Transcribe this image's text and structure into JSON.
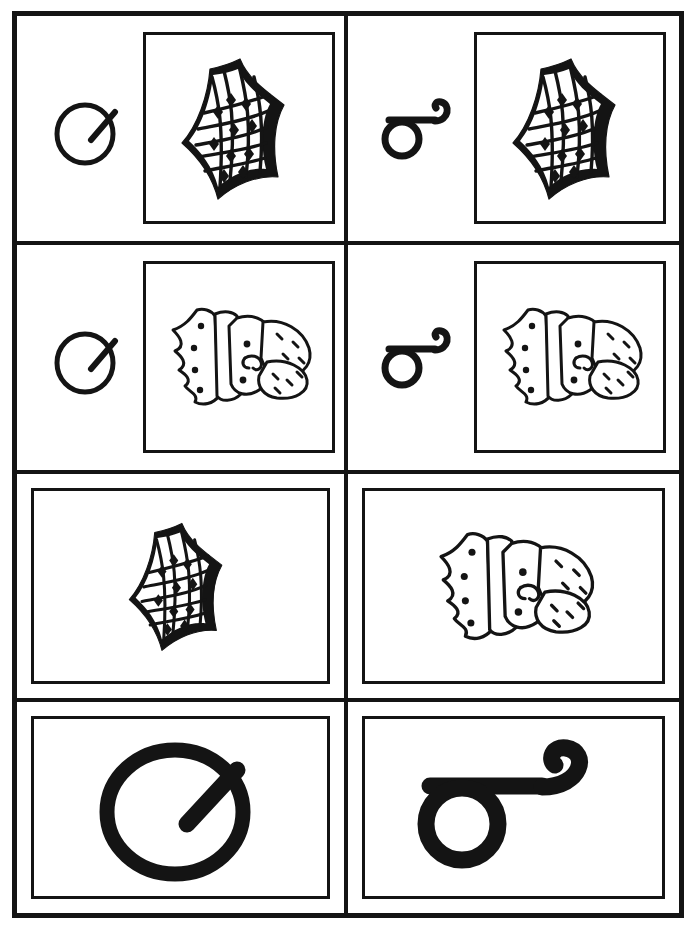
{
  "sheet": {
    "kind": "letter-and-picture-worksheet",
    "layout": "2-columns-by-4-rows",
    "background_color": "#ffffff",
    "ink_color": "#141414",
    "columns": [
      {
        "id": "left",
        "letter_name": "letter-o-with-tick"
      },
      {
        "id": "right",
        "letter_name": "letter-loop-with-hook"
      }
    ],
    "rows": [
      {
        "id": "row-1",
        "content": "letter-plus-square-picture"
      },
      {
        "id": "row-2",
        "content": "letter-plus-square-picture"
      },
      {
        "id": "row-3",
        "content": "wide-picture-only"
      },
      {
        "id": "row-4",
        "content": "wide-large-letter-only"
      }
    ]
  },
  "cells": {
    "r1c1": {
      "label": "",
      "letter": "letter-o-with-tick",
      "picture": "woven-mat"
    },
    "r1c2": {
      "label": "",
      "letter": "letter-loop-with-hook",
      "picture": "woven-mat"
    },
    "r2c1": {
      "label": "",
      "letter": "letter-o-with-tick",
      "picture": "swaddled-baby"
    },
    "r2c2": {
      "label": "",
      "letter": "letter-loop-with-hook",
      "picture": "swaddled-baby"
    },
    "r3c1": {
      "label": "",
      "letter": "",
      "picture": "woven-mat"
    },
    "r3c2": {
      "label": "",
      "letter": "",
      "picture": "swaddled-baby"
    },
    "r4c1": {
      "label": "",
      "letter": "letter-o-with-tick",
      "picture": ""
    },
    "r4c2": {
      "label": "",
      "letter": "letter-loop-with-hook",
      "picture": ""
    }
  },
  "pictures": {
    "woven-mat": {
      "name": "woven-mat",
      "description": "diamond-patterned woven mat"
    },
    "swaddled-baby": {
      "name": "swaddled-baby",
      "description": "baby wrapped in a blanket with bonnet"
    }
  }
}
